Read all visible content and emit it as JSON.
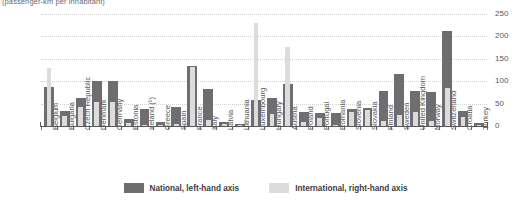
{
  "subtitle": "(passenger-km per inhabitant)",
  "legend": {
    "items": [
      {
        "label": "National, left-hand axis",
        "color": "#6e6e70",
        "key": "national"
      },
      {
        "label": "International, right-hand axis",
        "color": "#dcdcdc",
        "key": "international"
      }
    ]
  },
  "axes": {
    "left_ticks": [
      "2500",
      "2000",
      "1500",
      "1000",
      "500",
      "0"
    ],
    "right_ticks": [
      "250",
      "200",
      "150",
      "100",
      "50",
      "0"
    ]
  },
  "chart_data": {
    "type": "bar",
    "title": "",
    "subtitle": "(passenger-km per inhabitant)",
    "xlabel": "",
    "ylabel": "",
    "y2label": "",
    "ylim": [
      0,
      2500
    ],
    "y2lim": [
      0,
      250
    ],
    "grid": true,
    "legend_position": "bottom",
    "categories": [
      "Belgium",
      "Bulgaria",
      "Czech Republic",
      "Denmark",
      "Germany",
      "Estonia",
      "Ireland (¹)",
      "Greece",
      "Spain",
      "France",
      "Italy",
      "Latvia",
      "Lithuania",
      "Luxembourg",
      "Hungary",
      "Austria",
      "Poland",
      "Portugal",
      "Romania",
      "Slovenia",
      "Slovakia",
      "Finland",
      "Sweden",
      "United Kingdom",
      "Norway",
      "Switzerland",
      "Croatia",
      "Turkey"
    ],
    "series": [
      {
        "name": "National, left-hand axis",
        "axis": "left",
        "color": "#6e6e70",
        "values": [
          880,
          330,
          620,
          1000,
          1010,
          150,
          390,
          90,
          420,
          1350,
          830,
          100,
          40,
          570,
          620,
          930,
          320,
          300,
          290,
          390,
          400,
          780,
          1150,
          790,
          760,
          2110,
          340,
          60
        ]
      },
      {
        "name": "International, right-hand axis",
        "axis": "right",
        "color": "#dcdcdc",
        "values": [
          130,
          22,
          43,
          53,
          54,
          7,
          3,
          2,
          5,
          132,
          14,
          4,
          2,
          231,
          27,
          176,
          10,
          18,
          3,
          32,
          35,
          11,
          24,
          32,
          12,
          84,
          20,
          2
        ]
      }
    ]
  }
}
